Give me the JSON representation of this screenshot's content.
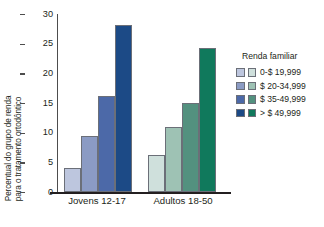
{
  "chart_data": {
    "type": "bar",
    "title": "",
    "xlabel": "",
    "ylabel_line1": "Percentual do grupo de renda",
    "ylabel_line2": "para o tratamento ortodôntico",
    "categories": [
      "Jovens 12-17",
      "Adultos 18-50"
    ],
    "legend_title": "Renda familiar",
    "legend_position": "right",
    "grid": false,
    "ylim": [
      0,
      30
    ],
    "yticks": [
      30,
      25,
      20,
      15,
      10,
      5,
      0
    ],
    "ytick_labels": [
      "30",
      "25",
      "20",
      "15",
      "10",
      "5",
      "0"
    ],
    "series": [
      {
        "name": "0-$ 19,999",
        "values": [
          4.0,
          6.3
        ],
        "color_young": "#bdc6de",
        "color_adult": "#cfe0dc"
      },
      {
        "name": "$ 20-34,999",
        "values": [
          9.5,
          11.0
        ],
        "color_young": "#8b9bc4",
        "color_adult": "#9ec2b4"
      },
      {
        "name": "$ 35-49,999",
        "values": [
          16.1,
          15.0
        ],
        "color_young": "#4c69a8",
        "color_adult": "#53917f"
      },
      {
        "name": "> $ 49,999",
        "values": [
          28.2,
          24.3
        ],
        "color_young": "#1c4a86",
        "color_adult": "#10795c"
      }
    ]
  },
  "legend": {
    "title": "Renda familiar",
    "items": [
      {
        "label": "0-$ 19,999",
        "blue": "#bdc6de",
        "green": "#cfe0dc"
      },
      {
        "label": "$ 20-34,999",
        "blue": "#8b9bc4",
        "green": "#9ec2b4"
      },
      {
        "label": "$ 35-49,999",
        "blue": "#4c69a8",
        "green": "#53917f"
      },
      {
        "label": "> $ 49,999",
        "blue": "#1c4a86",
        "green": "#10795c"
      }
    ]
  },
  "axes": {
    "y_title_line1": "Percentual do grupo de renda",
    "y_title_line2": "para o tratamento ortodôntico",
    "y_ticks": [
      "30",
      "25",
      "20",
      "15",
      "10",
      "5",
      "0"
    ],
    "x_categories": [
      "Jovens 12-17",
      "Adultos 18-50"
    ]
  }
}
